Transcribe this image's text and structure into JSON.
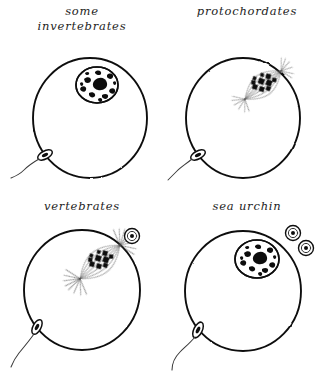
{
  "figure": {
    "width": 329,
    "height": 389,
    "background_color": "#ffffff",
    "ink_color": "#111111",
    "style": "hand-drawn pen-and-ink biological diagram",
    "layout": "2x2 grid of panels, each a circular egg cell with a sperm fusing at the lower-left membrane"
  },
  "panels": [
    {
      "id": "some-invertebrates",
      "label": "some\ninvertebrates",
      "label_lines": [
        "some",
        "invertebrates"
      ],
      "grid_position": "top-left",
      "nuclear_state": "intact nucleus (germinal vesicle) with mottled chromatin",
      "has_spindle": false,
      "polar_body_count": 0,
      "sperm_present": true,
      "sperm_position": "lower-left of egg membrane"
    },
    {
      "id": "protochordates",
      "label": "protochordates",
      "label_lines": [
        "protochordates"
      ],
      "grid_position": "top-right",
      "nuclear_state": "metaphase spindle with dark chromosomes and radiating fibers",
      "has_spindle": true,
      "polar_body_count": 0,
      "sperm_present": true,
      "sperm_position": "lower-left of egg membrane"
    },
    {
      "id": "vertebrates",
      "label": "vertebrates",
      "label_lines": [
        "vertebrates"
      ],
      "grid_position": "bottom-left",
      "nuclear_state": "metaphase spindle with asters at both poles",
      "has_spindle": true,
      "polar_body_count": 1,
      "sperm_present": true,
      "sperm_position": "lower-left of egg membrane"
    },
    {
      "id": "sea-urchin",
      "label": "sea urchin",
      "label_lines": [
        "sea urchin"
      ],
      "grid_position": "bottom-right",
      "nuclear_state": "intact female pronucleus with mottled chromatin",
      "has_spindle": false,
      "polar_body_count": 2,
      "sperm_present": true,
      "sperm_position": "lower-left of egg membrane"
    }
  ]
}
